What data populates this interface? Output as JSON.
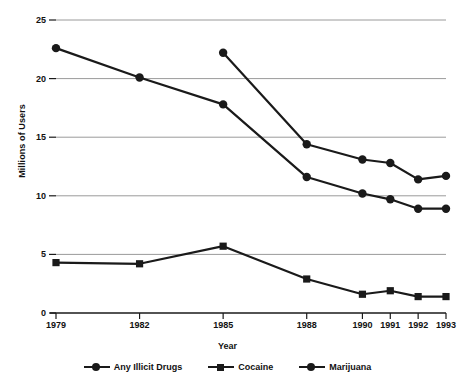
{
  "chart_data": {
    "type": "line",
    "title": "",
    "xlabel": "Year",
    "ylabel": "Millions of Users",
    "categories": [
      "1979",
      "1982",
      "1985",
      "1988",
      "1990",
      "1991",
      "1992",
      "1993"
    ],
    "x": [
      1979,
      1982,
      1985,
      1988,
      1990,
      1991,
      1992,
      1993
    ],
    "ylim": [
      0,
      25
    ],
    "yticks": [
      "0",
      "5",
      "10",
      "15",
      "20",
      "25"
    ],
    "ytick_values": [
      0,
      5,
      10,
      15,
      20,
      25
    ],
    "grid": "horizontal",
    "legend_position": "bottom",
    "series": [
      {
        "name": "Any Illicit Drugs",
        "marker": "circle",
        "color": "#1a1a1a",
        "values": [
          null,
          null,
          22.2,
          14.4,
          13.1,
          12.8,
          11.4,
          11.7
        ]
      },
      {
        "name": "Cocaine",
        "marker": "square",
        "color": "#1a1a1a",
        "values": [
          4.3,
          4.2,
          5.7,
          2.9,
          1.6,
          1.9,
          1.4,
          1.4
        ]
      },
      {
        "name": "Marijuana",
        "marker": "circle",
        "color": "#1a1a1a",
        "values": [
          22.6,
          20.1,
          17.8,
          11.6,
          10.2,
          9.7,
          8.9,
          8.9
        ]
      }
    ]
  },
  "axis": {
    "y_title": "Millions of Users",
    "x_title": "Year"
  },
  "legend": {
    "items": [
      {
        "label": "Any Illicit Drugs",
        "marker": "circle"
      },
      {
        "label": "Cocaine",
        "marker": "square"
      },
      {
        "label": "Marijuana",
        "marker": "circle"
      }
    ]
  },
  "colors": {
    "ink": "#1a1a1a",
    "grid": "#9a9a9a",
    "axis": "#1a1a1a",
    "background": "#ffffff"
  }
}
